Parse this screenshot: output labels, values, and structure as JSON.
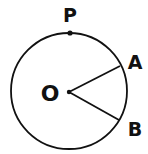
{
  "diagram": {
    "labels": {
      "center": "O",
      "point_top": "P",
      "point_a": "A",
      "point_b": "B"
    },
    "colors": {
      "stroke": "#111111",
      "background": "#ffffff"
    }
  }
}
